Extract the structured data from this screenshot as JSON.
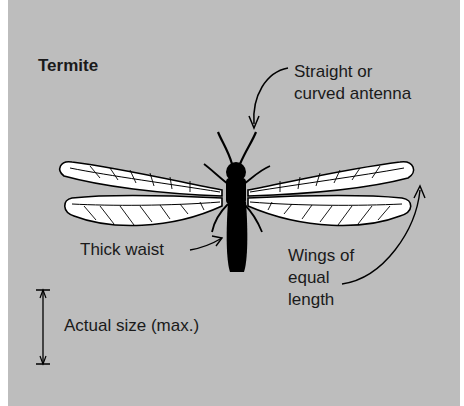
{
  "diagram": {
    "title": "Termite",
    "labels": {
      "antenna_line1": "Straight or",
      "antenna_line2": "curved antenna",
      "waist": "Thick waist",
      "wings_line1": "Wings of",
      "wings_line2": "equal",
      "wings_line3": "length",
      "size": "Actual size (max.)"
    },
    "colors": {
      "background": "#bdbdbd",
      "insect_body": "#000000",
      "wing_fill": "#ffffff",
      "text": "#1a1a1a"
    }
  }
}
